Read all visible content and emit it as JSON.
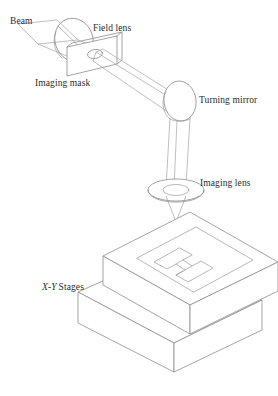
{
  "figure": {
    "background_color": "#ffffff",
    "line_color": "#8e8e8e",
    "text_color": "#2b2b2b",
    "labels": {
      "beam": "Beam",
      "field_lens": "Field lens",
      "imaging_mask": "Imaging mask",
      "turning_mirror": "Turning mirror",
      "imaging_lens": "Imaging lens",
      "xy_stages_x": "X",
      "xy_stages_dash": "-",
      "xy_stages_y": "Y",
      "xy_stages_word": "Stages"
    },
    "components": [
      {
        "name": "beam",
        "label": "Beam",
        "shape": "ribbon"
      },
      {
        "name": "field-lens",
        "label": "Field lens",
        "shape": "tilted-disc"
      },
      {
        "name": "imaging-mask",
        "label": "Imaging mask",
        "shape": "plate-with-aperture"
      },
      {
        "name": "turning-mirror",
        "label": "Turning mirror",
        "shape": "tilted-disc"
      },
      {
        "name": "imaging-lens",
        "label": "Imaging lens",
        "shape": "flat-disc"
      },
      {
        "name": "xy-stages",
        "label": "X-Y Stages",
        "shape": "stacked-slabs"
      },
      {
        "name": "workpiece-pattern",
        "label": "H",
        "shape": "h-groove"
      }
    ]
  }
}
